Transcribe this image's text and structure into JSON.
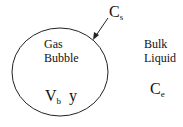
{
  "diagram": {
    "bubble": {
      "label_line1": "Gas",
      "label_line2": "Bubble",
      "volume_symbol": "V",
      "volume_sub": "b",
      "fraction_symbol": "y"
    },
    "surface": {
      "symbol": "C",
      "sub": "s"
    },
    "bulk": {
      "label_line1": "Bulk",
      "label_line2": "Liquid",
      "symbol": "C",
      "sub": "e"
    }
  }
}
